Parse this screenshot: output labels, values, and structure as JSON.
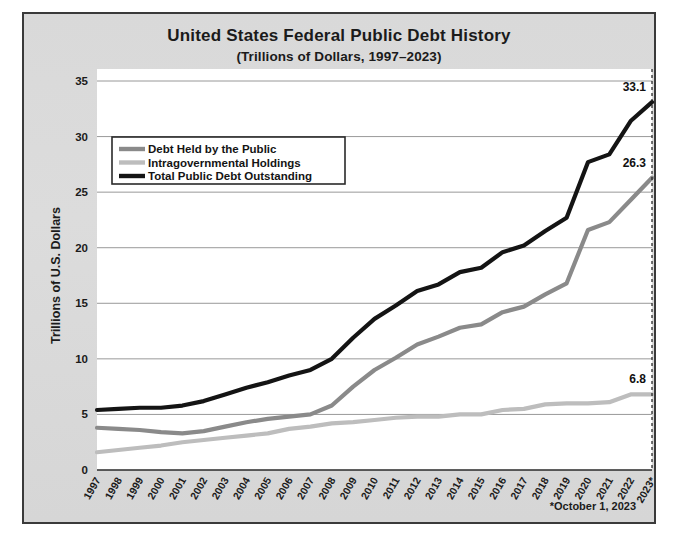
{
  "chart_data": {
    "type": "line",
    "title": "United States Federal Public Debt History",
    "subtitle": "(Trillions of Dollars, 1997–2023)",
    "xlabel": "",
    "ylabel": "Trillions of U.S. Dollars",
    "ylim": [
      0,
      35
    ],
    "ytick_step": 5,
    "yticks": [
      "0",
      "5",
      "10",
      "15",
      "20",
      "25",
      "30",
      "35"
    ],
    "grid": true,
    "legend_position": "upper-left",
    "categories": [
      "1997",
      "1998",
      "1999",
      "2000",
      "2001",
      "2002",
      "2003",
      "2004",
      "2005",
      "2006",
      "2007",
      "2008",
      "2009",
      "2010",
      "2011",
      "2012",
      "2013",
      "2014",
      "2015",
      "2016",
      "2017",
      "2018",
      "2019",
      "2020",
      "2021",
      "2022",
      "2023*"
    ],
    "series": [
      {
        "name": "Debt Held by the Public",
        "color": "#8a8a8a",
        "values": [
          3.8,
          3.7,
          3.6,
          3.4,
          3.3,
          3.5,
          3.9,
          4.3,
          4.6,
          4.8,
          5.0,
          5.8,
          7.5,
          9.0,
          10.1,
          11.3,
          12.0,
          12.8,
          13.1,
          14.2,
          14.7,
          15.8,
          16.8,
          21.6,
          22.3,
          24.3,
          26.3
        ],
        "end_label": "26.3"
      },
      {
        "name": "Intragovernmental Holdings",
        "color": "#bdbdbd",
        "values": [
          1.6,
          1.8,
          2.0,
          2.2,
          2.5,
          2.7,
          2.9,
          3.1,
          3.3,
          3.7,
          3.9,
          4.2,
          4.3,
          4.5,
          4.7,
          4.8,
          4.8,
          5.0,
          5.0,
          5.4,
          5.5,
          5.9,
          6.0,
          6.0,
          6.1,
          6.8,
          6.8
        ],
        "end_label": "6.8"
      },
      {
        "name": "Total Public Debt Outstanding",
        "color": "#141414",
        "values": [
          5.4,
          5.5,
          5.6,
          5.6,
          5.8,
          6.2,
          6.8,
          7.4,
          7.9,
          8.5,
          9.0,
          10.0,
          11.9,
          13.6,
          14.8,
          16.1,
          16.7,
          17.8,
          18.2,
          19.6,
          20.2,
          21.5,
          22.7,
          27.7,
          28.4,
          31.4,
          33.1
        ],
        "end_label": "33.1"
      }
    ],
    "annotations": {
      "end_marker_year": "2023*",
      "end_marker_style": "dashed-vertical"
    }
  },
  "footnote": "*October 1, 2023"
}
